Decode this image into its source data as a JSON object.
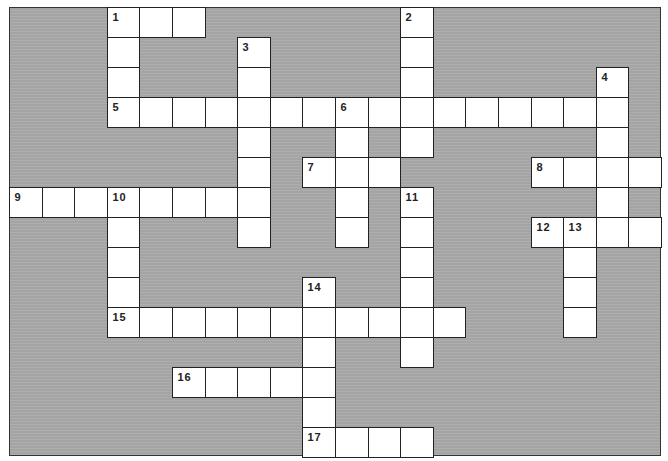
{
  "puzzle": {
    "grid": {
      "cols": 20,
      "rows": 15,
      "origin_x": 9,
      "origin_y": 7,
      "cell_w": 32.6,
      "cell_h": 30
    },
    "colors": {
      "background": "#a9a9a9",
      "cell": "#ffffff",
      "line": "#222222"
    },
    "entries": [
      {
        "number": "1",
        "direction": "across",
        "row": 0,
        "col": 3,
        "length": 3
      },
      {
        "number": "1",
        "direction": "down",
        "row": 0,
        "col": 3,
        "length": 4
      },
      {
        "number": "2",
        "direction": "down",
        "row": 0,
        "col": 12,
        "length": 5
      },
      {
        "number": "3",
        "direction": "down",
        "row": 1,
        "col": 7,
        "length": 7
      },
      {
        "number": "4",
        "direction": "down",
        "row": 2,
        "col": 18,
        "length": 6
      },
      {
        "number": "5",
        "direction": "across",
        "row": 3,
        "col": 3,
        "length": 16
      },
      {
        "number": "6",
        "direction": "down",
        "row": 3,
        "col": 10,
        "length": 5
      },
      {
        "number": "7",
        "direction": "across",
        "row": 5,
        "col": 9,
        "length": 3
      },
      {
        "number": "8",
        "direction": "across",
        "row": 5,
        "col": 16,
        "length": 4
      },
      {
        "number": "9",
        "direction": "across",
        "row": 6,
        "col": 0,
        "length": 8
      },
      {
        "number": "10",
        "direction": "down",
        "row": 6,
        "col": 3,
        "length": 5
      },
      {
        "number": "11",
        "direction": "down",
        "row": 6,
        "col": 12,
        "length": 6
      },
      {
        "number": "12",
        "direction": "across",
        "row": 7,
        "col": 16,
        "length": 4
      },
      {
        "number": "13",
        "direction": "down",
        "row": 7,
        "col": 17,
        "length": 4
      },
      {
        "number": "14",
        "direction": "down",
        "row": 9,
        "col": 9,
        "length": 6
      },
      {
        "number": "15",
        "direction": "across",
        "row": 10,
        "col": 3,
        "length": 11
      },
      {
        "number": "16",
        "direction": "across",
        "row": 12,
        "col": 5,
        "length": 5
      },
      {
        "number": "17",
        "direction": "across",
        "row": 14,
        "col": 9,
        "length": 4
      }
    ]
  }
}
